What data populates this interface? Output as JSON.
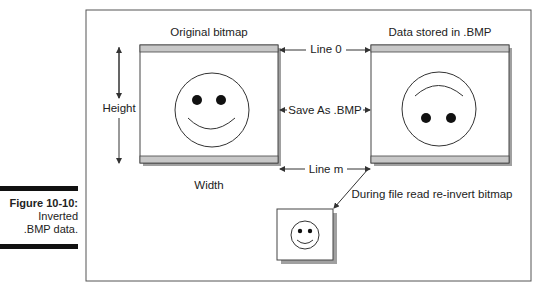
{
  "caption": {
    "figure_number": "Figure 10-10:",
    "line1": "Inverted",
    "line2": ".BMP data."
  },
  "diagram": {
    "left_box_title": "Original bitmap",
    "right_box_title": "Data stored in .BMP",
    "height_label": "Height",
    "width_label": "Width",
    "line0_label": "Line 0",
    "save_label": "Save As .BMP",
    "linem_label": "Line m",
    "reinvert_label": "During file read re-invert bitmap"
  },
  "colors": {
    "stripe": "#c8c8c8",
    "shadow": "#a0a0a0",
    "line": "#333333"
  }
}
